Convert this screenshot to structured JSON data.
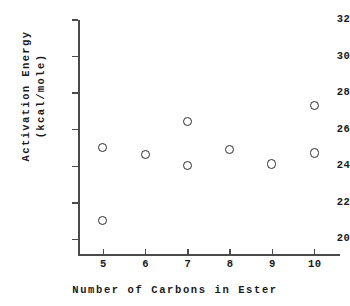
{
  "chart_data": {
    "type": "scatter",
    "title": "",
    "xlabel": "Number of Carbons in Ester",
    "ylabel": "Activation Energy\n(kcal/mole)",
    "ylabel_line1": "Activation Energy",
    "ylabel_line2": "(kcal/mole)",
    "xlim": [
      4.4,
      10.6
    ],
    "ylim": [
      19.2,
      32
    ],
    "xticks": [
      5,
      6,
      7,
      8,
      9,
      10
    ],
    "xtick_labels": [
      "5",
      "6",
      "7",
      "8",
      "9",
      "10"
    ],
    "yticks": [
      20,
      22,
      24,
      26,
      28,
      30,
      32
    ],
    "ytick_labels": [
      "20",
      "22",
      "24",
      "26",
      "28",
      "30",
      "32"
    ],
    "grid": false,
    "legend": false,
    "marker_style": "open-circle",
    "marker_color": "#2b2b2b",
    "axis_color": "#4a4a4a",
    "background": "#ffffff",
    "x": [
      5,
      5,
      6,
      7,
      7,
      8,
      9,
      10,
      10
    ],
    "y": [
      25.0,
      21.0,
      24.6,
      26.4,
      24.0,
      24.9,
      24.1,
      27.3,
      24.7
    ],
    "points": [
      {
        "x": 5,
        "y": 25.0
      },
      {
        "x": 5,
        "y": 21.0
      },
      {
        "x": 6,
        "y": 24.6
      },
      {
        "x": 7,
        "y": 26.4
      },
      {
        "x": 7,
        "y": 24.0
      },
      {
        "x": 8,
        "y": 24.9
      },
      {
        "x": 9,
        "y": 24.1
      },
      {
        "x": 10,
        "y": 27.3
      },
      {
        "x": 10,
        "y": 24.7
      }
    ]
  }
}
